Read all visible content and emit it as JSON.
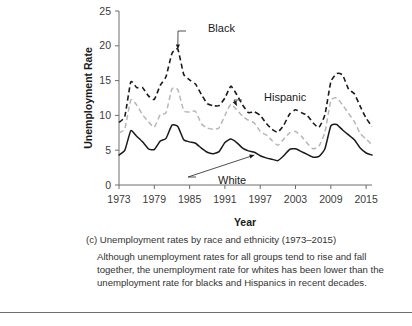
{
  "chart_data": {
    "type": "line",
    "title": "",
    "xlabel": "Year",
    "ylabel": "Unemployment Rate",
    "xlim": [
      1973,
      2016
    ],
    "ylim": [
      0,
      25
    ],
    "xticks": [
      1973,
      1979,
      1985,
      1991,
      1997,
      2003,
      2009,
      2015
    ],
    "yticks": [
      0,
      5,
      10,
      15,
      20,
      25
    ],
    "grid": false,
    "legend_position": "inline-annotations",
    "x": [
      1973,
      1974,
      1975,
      1976,
      1977,
      1978,
      1979,
      1980,
      1981,
      1982,
      1983,
      1984,
      1985,
      1986,
      1987,
      1988,
      1989,
      1990,
      1991,
      1992,
      1993,
      1994,
      1995,
      1996,
      1997,
      1998,
      1999,
      2000,
      2001,
      2002,
      2003,
      2004,
      2005,
      2006,
      2007,
      2008,
      2009,
      2010,
      2011,
      2012,
      2013,
      2014,
      2015,
      2016
    ],
    "series": [
      {
        "name": "Black",
        "color": "#1a1a1a",
        "style": "dashed",
        "values": [
          9.0,
          9.9,
          14.8,
          14.0,
          14.0,
          12.8,
          12.3,
          14.3,
          15.6,
          18.9,
          19.5,
          15.9,
          15.1,
          14.5,
          13.0,
          11.7,
          11.4,
          11.4,
          12.5,
          14.2,
          13.0,
          11.5,
          10.4,
          10.5,
          10.0,
          8.9,
          8.0,
          7.6,
          8.6,
          10.2,
          10.8,
          10.4,
          10.0,
          8.9,
          8.3,
          10.1,
          14.8,
          16.0,
          15.8,
          13.8,
          13.1,
          11.3,
          9.6,
          8.4
        ]
      },
      {
        "name": "Hispanic",
        "color": "#b6b6b6",
        "style": "dashed",
        "values": [
          7.5,
          8.1,
          12.2,
          11.5,
          10.1,
          9.1,
          8.3,
          10.1,
          10.4,
          13.8,
          13.7,
          10.7,
          10.5,
          10.6,
          8.8,
          8.2,
          8.0,
          8.2,
          10.0,
          11.6,
          10.8,
          9.9,
          9.3,
          8.9,
          7.7,
          7.2,
          6.4,
          5.7,
          6.6,
          7.5,
          7.7,
          7.0,
          6.0,
          5.2,
          5.6,
          7.6,
          12.1,
          12.5,
          11.5,
          10.3,
          9.1,
          7.4,
          6.6,
          5.8
        ]
      },
      {
        "name": "White",
        "color": "#1a1a1a",
        "style": "solid",
        "values": [
          4.3,
          5.0,
          7.8,
          7.0,
          6.2,
          5.2,
          5.1,
          6.3,
          6.7,
          8.6,
          8.4,
          6.5,
          6.2,
          6.0,
          5.3,
          4.7,
          4.5,
          4.8,
          6.1,
          6.6,
          6.1,
          5.3,
          4.9,
          4.7,
          4.2,
          3.9,
          3.7,
          3.5,
          4.2,
          5.1,
          5.2,
          4.8,
          4.4,
          4.0,
          4.1,
          5.2,
          8.5,
          8.7,
          7.9,
          7.2,
          6.5,
          5.3,
          4.6,
          4.3
        ]
      }
    ],
    "annotations": [
      {
        "text": "Black",
        "points_to_year": 1983,
        "points_to_value": 19.5
      },
      {
        "text": "Hispanic",
        "points_to_year": 1993,
        "points_to_value": 11.4
      },
      {
        "text": "White",
        "points_to_year": 1996,
        "points_to_value": 4.3
      }
    ]
  },
  "caption": {
    "label": "(c)",
    "title": "Unemployment rates by race and ethnicity (1973–2015)",
    "body": "Although unemployment rates for all groups tend to rise and fall together, the unemployment rate for whites has been lower than the unemployment rate for blacks and Hispanics in recent decades."
  },
  "colors": {
    "axis": "#6e6e6e",
    "text": "#333333",
    "black_series": "#1a1a1a",
    "hispanic_series": "#b6b6b6",
    "white_series": "#1a1a1a"
  }
}
